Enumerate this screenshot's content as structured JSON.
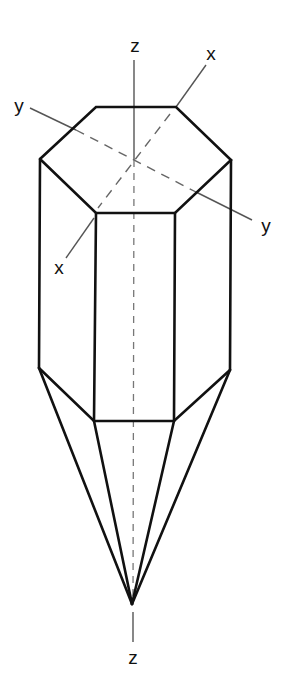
{
  "figure": {
    "labels": {
      "z_top": "z",
      "z_bottom": "z",
      "x_top": "x",
      "x_bottom": "x",
      "y_left": "y",
      "y_right": "y"
    },
    "colors": {
      "edges": "#111111",
      "axes": "#555555",
      "background": "#ffffff"
    }
  }
}
